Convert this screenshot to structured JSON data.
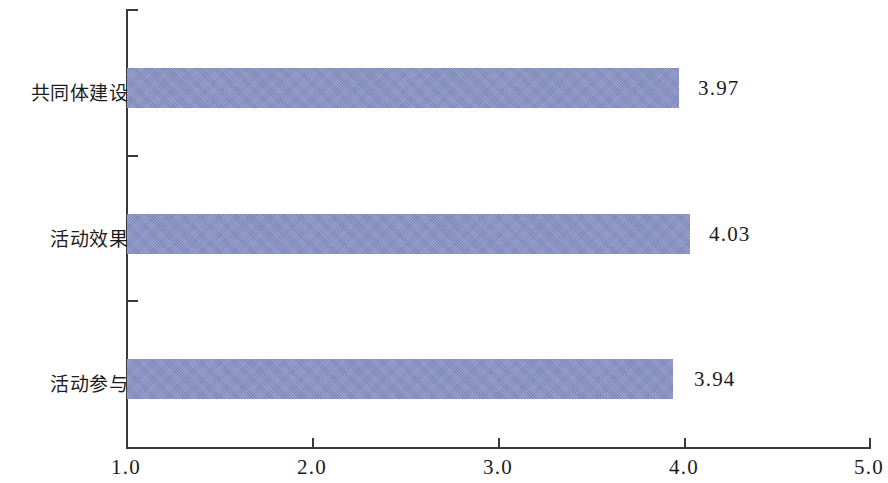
{
  "chart_data": {
    "type": "bar",
    "orientation": "horizontal",
    "title": "",
    "subtitle": "",
    "xlabel": "",
    "ylabel": "",
    "categories": [
      "活动参与",
      "活动效果",
      "共同体建设"
    ],
    "values": [
      3.94,
      4.03,
      3.97
    ],
    "value_labels": [
      "3.94",
      "4.03",
      "3.97"
    ],
    "xlim": [
      1.0,
      5.0
    ],
    "xticks": [
      1.0,
      2.0,
      3.0,
      4.0,
      5.0
    ],
    "xtick_labels": [
      "1.0",
      "2.0",
      "3.0",
      "4.0",
      "5.0"
    ],
    "grid": false,
    "legend": null,
    "legend_position": "none",
    "bar_color": "#8690c6",
    "axis_color": "#3a3a3a",
    "background_color": "#ffffff",
    "series": [
      {
        "name": "",
        "values": [
          3.94,
          4.03,
          3.97
        ]
      }
    ],
    "bars": [
      {
        "category": "共同体建设",
        "value": 3.97,
        "label": "3.97"
      },
      {
        "category": "活动效果",
        "value": 4.03,
        "label": "4.03"
      },
      {
        "category": "活动参与",
        "value": 3.94,
        "label": "3.94"
      }
    ]
  }
}
